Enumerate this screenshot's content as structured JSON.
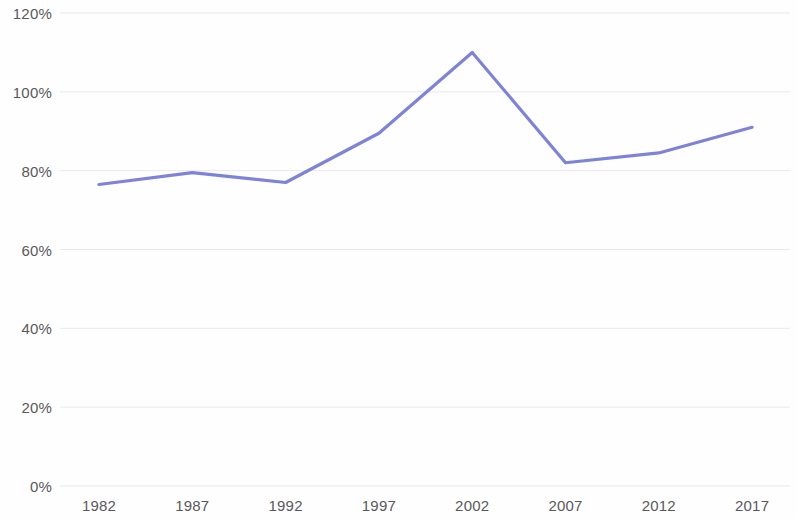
{
  "chart_data": {
    "type": "line",
    "title": "",
    "subtitle": "",
    "xlabel": "",
    "ylabel": "",
    "categories": [
      "1982",
      "1987",
      "1992",
      "1997",
      "2002",
      "2007",
      "2012",
      "2017"
    ],
    "series": [
      {
        "name": "",
        "values": [
          76.5,
          79.5,
          77,
          89.5,
          110,
          82,
          84.5,
          91
        ],
        "color": "#7f83d6"
      }
    ],
    "ylim": [
      0,
      120
    ],
    "ytick_values": [
      0,
      20,
      40,
      60,
      80,
      100,
      120
    ],
    "ytick_labels": [
      "0%",
      "20%",
      "40%",
      "60%",
      "80%",
      "100%",
      "120%"
    ],
    "xtick_labels": [
      "1982",
      "1987",
      "1992",
      "1997",
      "2002",
      "2007",
      "2012",
      "2017"
    ],
    "grid": true,
    "grid_axis": "y",
    "legend": false,
    "legend_position": "none",
    "annotations": []
  },
  "style": {
    "background": "#fefefe",
    "gridline_color": "#e9e9ee",
    "tick_label_color": "#58595b",
    "line_color": "#7f83d6"
  }
}
